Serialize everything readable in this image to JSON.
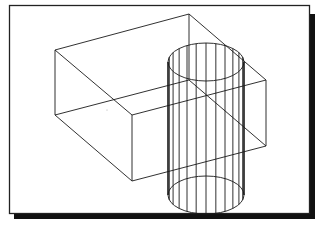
{
  "diagram": {
    "colors": {
      "background": "#ffffff",
      "line": "#1a1a1a",
      "frame": "#222222",
      "shadow": "#111111"
    },
    "objects": [
      {
        "name": "rectangular-box",
        "type": "box",
        "style": "wireframe"
      },
      {
        "name": "vertical-cylinder",
        "type": "cylinder",
        "style": "wireframe",
        "generator_lines": 12
      }
    ]
  }
}
